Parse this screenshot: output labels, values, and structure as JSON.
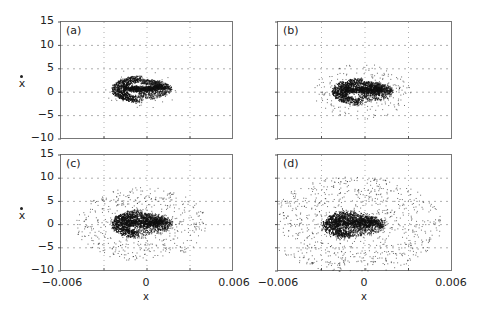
{
  "figure": {
    "panels": [
      {
        "id": "a",
        "label": "(a)"
      },
      {
        "id": "b",
        "label": "(b)"
      },
      {
        "id": "c",
        "label": "(c)"
      },
      {
        "id": "d",
        "label": "(d)"
      }
    ],
    "y_ticks": [
      "15",
      "10",
      "5",
      "0",
      "−5",
      "−10"
    ],
    "x_ticks": [
      "−0.006",
      "0",
      "0.006"
    ],
    "x_axis_label": "x",
    "y_axis_label": "x"
  },
  "chart_data": {
    "type": "scatter",
    "title": "",
    "xlabel": "x",
    "ylabel": "ẋ (x-dot)",
    "xlim": [
      -0.006,
      0.006
    ],
    "ylim": [
      -10,
      15
    ],
    "x_ticks": [
      -0.006,
      0,
      0.006
    ],
    "y_ticks": [
      15,
      10,
      5,
      0,
      -5,
      -10
    ],
    "grid": {
      "on": true,
      "style": "dotted",
      "x": [
        -0.003,
        0,
        0.003
      ],
      "y": [
        10,
        5,
        0,
        -5
      ]
    },
    "layout": "2x2",
    "panels": [
      {
        "label": "(a)",
        "description": "Compact kidney-shaped phase portrait attractor, dense band",
        "x_range": [
          -0.0025,
          0.0018
        ],
        "y_range": [
          -2.5,
          3.8
        ],
        "center": [
          -0.0004,
          0.7
        ],
        "scatter_spread": 0.05
      },
      {
        "label": "(b)",
        "description": "Slightly diffused kidney attractor",
        "x_range": [
          -0.0025,
          0.002
        ],
        "y_range": [
          -4,
          3.8
        ],
        "center": [
          -0.0002,
          0.2
        ],
        "scatter_spread": 0.25
      },
      {
        "label": "(c)",
        "description": "Attractor with spiraling core and sparse halo",
        "x_range": [
          -0.0045,
          0.0025
        ],
        "y_range": [
          -6,
          6
        ],
        "center": [
          -0.0004,
          0.2
        ],
        "scatter_spread": 0.6
      },
      {
        "label": "(d)",
        "description": "Highly diffused cloud around central spiral",
        "x_range": [
          -0.006,
          0.0035
        ],
        "y_range": [
          -9,
          11
        ],
        "center": [
          -0.0008,
          0.0
        ],
        "scatter_spread": 1.0
      }
    ]
  }
}
